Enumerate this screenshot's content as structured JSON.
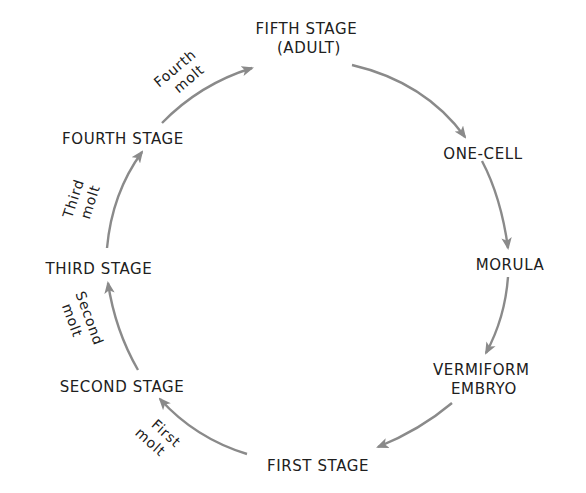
{
  "diagram": {
    "type": "life-cycle",
    "colors": {
      "arrow": "#8a8a8a",
      "text": "#202020",
      "background": "#ffffff"
    },
    "stages": [
      {
        "id": "fifth",
        "line1": "FIFTH STAGE",
        "line2": "(ADULT)"
      },
      {
        "id": "one-cell",
        "line1": "ONE-CELL"
      },
      {
        "id": "morula",
        "line1": "MORULA"
      },
      {
        "id": "vermiform",
        "line1": "VERMIFORM",
        "line2": "EMBRYO"
      },
      {
        "id": "first",
        "line1": "FIRST STAGE"
      },
      {
        "id": "second",
        "line1": "SECOND STAGE"
      },
      {
        "id": "third",
        "line1": "THIRD STAGE"
      },
      {
        "id": "fourth",
        "line1": "FOURTH STAGE"
      }
    ],
    "molts": [
      {
        "id": "first-molt",
        "line1": "First",
        "line2": "molt"
      },
      {
        "id": "second-molt",
        "line1": "Second",
        "line2": "molt"
      },
      {
        "id": "third-molt",
        "line1": "Third",
        "line2": "molt"
      },
      {
        "id": "fourth-molt",
        "line1": "Fourth",
        "line2": "molt"
      }
    ],
    "transitions": [
      {
        "from": "FIFTH STAGE (ADULT)",
        "to": "ONE-CELL"
      },
      {
        "from": "ONE-CELL",
        "to": "MORULA"
      },
      {
        "from": "MORULA",
        "to": "VERMIFORM EMBRYO"
      },
      {
        "from": "VERMIFORM EMBRYO",
        "to": "FIRST STAGE"
      },
      {
        "from": "FIRST STAGE",
        "to": "SECOND STAGE",
        "label": "First molt"
      },
      {
        "from": "SECOND STAGE",
        "to": "THIRD STAGE",
        "label": "Second molt"
      },
      {
        "from": "THIRD STAGE",
        "to": "FOURTH STAGE",
        "label": "Third molt"
      },
      {
        "from": "FOURTH STAGE",
        "to": "FIFTH STAGE (ADULT)",
        "label": "Fourth molt"
      }
    ]
  }
}
